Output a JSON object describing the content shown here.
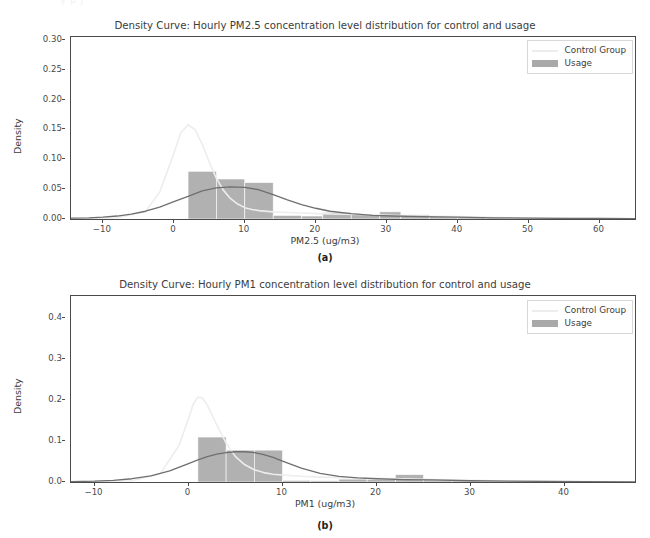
{
  "page": {
    "ghost_top_text": "y p j"
  },
  "figures": [
    {
      "id": "fig-a",
      "caption": "(a)",
      "title": "Density Curve: Hourly PM2.5 concentration level distribution for control and usage",
      "legend": {
        "control_label": "Control Group",
        "usage_label": "Usage",
        "control_color": "#ededed",
        "usage_color": "#a9a9a9"
      },
      "chart_data": {
        "type": "area",
        "title": "Density Curve: Hourly PM2.5 concentration level distribution for control and usage",
        "xlabel": "PM2.5 (ug/m3)",
        "ylabel": "Density",
        "xlim": [
          -14.5,
          65.0
        ],
        "ylim": [
          0.0,
          0.305
        ],
        "xticks": [
          -10,
          0,
          10,
          20,
          30,
          40,
          50,
          60
        ],
        "xtick_labels": [
          "-10",
          "0",
          "10",
          "20",
          "30",
          "40",
          "50",
          "60"
        ],
        "yticks": [
          0.0,
          0.05,
          0.1,
          0.15,
          0.2,
          0.25,
          0.3
        ],
        "ytick_labels": [
          "0.00",
          "0.05",
          "0.10",
          "0.15",
          "0.20",
          "0.25",
          "0.30"
        ],
        "grid": false,
        "legend_position": "upper right",
        "histogram": {
          "name": "Usage",
          "color": "#a9a9a9",
          "bin_edges": [
            2,
            6,
            10,
            14,
            18,
            21,
            25,
            29,
            32,
            36,
            40,
            44,
            48,
            52,
            56,
            60
          ],
          "bin_heights": [
            0.08,
            0.067,
            0.061,
            0.006,
            0.005,
            0.011,
            0.008,
            0.012,
            0.007,
            0.005,
            0.004,
            0.003,
            0.003,
            0.002,
            0.002
          ]
        },
        "series": [
          {
            "name": "Usage",
            "type": "kde-line",
            "color": "#6f6f6f",
            "x": [
              -14.5,
              -12,
              -10,
              -8,
              -6,
              -4,
              -2,
              0,
              2,
              4,
              6,
              8,
              10,
              12,
              14,
              16,
              18,
              20,
              22,
              25,
              28,
              31,
              35,
              40,
              45,
              50,
              55,
              60,
              65
            ],
            "y": [
              0.0015,
              0.002,
              0.003,
              0.005,
              0.008,
              0.013,
              0.02,
              0.029,
              0.038,
              0.047,
              0.052,
              0.054,
              0.053,
              0.049,
              0.041,
              0.032,
              0.024,
              0.018,
              0.013,
              0.009,
              0.006,
              0.005,
              0.004,
              0.003,
              0.002,
              0.0015,
              0.001,
              0.0008,
              0.0005
            ]
          },
          {
            "name": "Control Group",
            "type": "kde-line",
            "color": "#ededed",
            "x": [
              -14.5,
              -8,
              -4,
              -2,
              0,
              1,
              2,
              3,
              4,
              5,
              6,
              7,
              8,
              9,
              10,
              11,
              12,
              14,
              16,
              18,
              20,
              24,
              28,
              34,
              40,
              48,
              56,
              65
            ],
            "y": [
              0.0005,
              0.002,
              0.012,
              0.045,
              0.11,
              0.145,
              0.158,
              0.15,
              0.125,
              0.095,
              0.068,
              0.048,
              0.034,
              0.025,
              0.019,
              0.016,
              0.014,
              0.012,
              0.011,
              0.01,
              0.009,
              0.008,
              0.007,
              0.005,
              0.004,
              0.002,
              0.001,
              0.0005
            ]
          }
        ]
      }
    },
    {
      "id": "fig-b",
      "caption": "(b)",
      "title": "Density Curve: Hourly PM1 concentration level distribution for control and usage",
      "legend": {
        "control_label": "Control Group",
        "usage_label": "Usage",
        "control_color": "#ededed",
        "usage_color": "#a9a9a9"
      },
      "chart_data": {
        "type": "area",
        "title": "Density Curve: Hourly PM1 concentration level distribution for control and usage",
        "xlabel": "PM1 (ug/m3)",
        "ylabel": "Density",
        "xlim": [
          -12.5,
          47.5
        ],
        "ylim": [
          0.0,
          0.455
        ],
        "xticks": [
          -10,
          0,
          10,
          20,
          30,
          40
        ],
        "xtick_labels": [
          "-10",
          "0",
          "10",
          "20",
          "30",
          "40"
        ],
        "yticks": [
          0.0,
          0.1,
          0.2,
          0.3,
          0.4
        ],
        "ytick_labels": [
          "0.0",
          "0.1",
          "0.2",
          "0.3",
          "0.4"
        ],
        "grid": false,
        "legend_position": "upper right",
        "histogram": {
          "name": "Usage",
          "color": "#a9a9a9",
          "bin_edges": [
            1,
            4,
            7,
            10,
            13,
            16,
            19,
            22,
            25,
            28,
            31,
            34,
            37,
            40,
            43
          ],
          "bin_heights": [
            0.11,
            0.078,
            0.078,
            0.004,
            0.003,
            0.007,
            0.006,
            0.018,
            0.006,
            0.003,
            0.002,
            0.002,
            0.001,
            0.001
          ]
        },
        "series": [
          {
            "name": "Usage",
            "type": "kde-line",
            "color": "#6f6f6f",
            "x": [
              -12.5,
              -10,
              -8,
              -6,
              -4,
              -2,
              0,
              1,
              2,
              3,
              4,
              5,
              6,
              7,
              8,
              9,
              10,
              12,
              14,
              16,
              18,
              20,
              23,
              26,
              30,
              34,
              38,
              42,
              47.5
            ],
            "y": [
              0.001,
              0.002,
              0.004,
              0.008,
              0.015,
              0.027,
              0.045,
              0.054,
              0.062,
              0.068,
              0.072,
              0.074,
              0.074,
              0.072,
              0.067,
              0.06,
              0.051,
              0.034,
              0.021,
              0.014,
              0.01,
              0.008,
              0.006,
              0.005,
              0.003,
              0.002,
              0.0015,
              0.001,
              0.0005
            ]
          },
          {
            "name": "Control Group",
            "type": "kde-line",
            "color": "#ededed",
            "x": [
              -12.5,
              -6,
              -3,
              -1,
              0,
              0.5,
              1,
              1.5,
              2,
              3,
              4,
              5,
              6,
              7,
              8,
              9,
              10,
              12,
              14,
              17,
              20,
              24,
              28,
              33,
              38,
              43,
              47.5
            ],
            "y": [
              0.0005,
              0.003,
              0.02,
              0.09,
              0.155,
              0.19,
              0.208,
              0.205,
              0.188,
              0.14,
              0.095,
              0.062,
              0.042,
              0.03,
              0.023,
              0.019,
              0.017,
              0.014,
              0.012,
              0.01,
              0.009,
              0.007,
              0.005,
              0.003,
              0.002,
              0.001,
              0.0005
            ]
          }
        ]
      }
    }
  ]
}
